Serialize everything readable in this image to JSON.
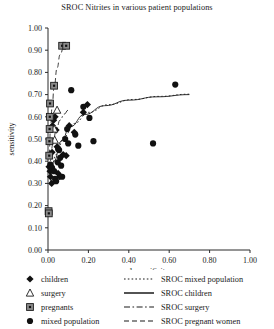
{
  "chart_data": {
    "type": "scatter",
    "title": "SROC Nitrites in various patient populations",
    "xlabel": "1-specificity",
    "ylabel": "sensitivity",
    "xlim": [
      0.0,
      1.0
    ],
    "ylim": [
      0.0,
      1.0
    ],
    "xticks": [
      "0.00",
      "0.20",
      "0.40",
      "0.60",
      "0.80",
      "1.00"
    ],
    "xtick_values": [
      0.0,
      0.2,
      0.4,
      0.6,
      0.8,
      1.0
    ],
    "yticks": [
      "0.00",
      "0.10",
      "0.20",
      "0.30",
      "0.40",
      "0.50",
      "0.60",
      "0.70",
      "0.80",
      "0.90",
      "1.00"
    ],
    "ytick_values": [
      0.0,
      0.1,
      0.2,
      0.3,
      0.4,
      0.5,
      0.6,
      0.7,
      0.8,
      0.9,
      1.0
    ],
    "grid": false,
    "legend_position": "below-plot",
    "series": [
      {
        "name": "children",
        "marker": "filled-diamond",
        "color": "#111111",
        "points": [
          [
            0.005,
            0.375
          ],
          [
            0.01,
            0.355
          ],
          [
            0.012,
            0.33
          ],
          [
            0.018,
            0.3
          ],
          [
            0.02,
            0.44
          ],
          [
            0.022,
            0.56
          ],
          [
            0.028,
            0.585
          ],
          [
            0.035,
            0.6
          ],
          [
            0.04,
            0.54
          ],
          [
            0.045,
            0.465
          ],
          [
            0.05,
            0.345
          ],
          [
            0.058,
            0.33
          ],
          [
            0.075,
            0.43
          ],
          [
            0.09,
            0.425
          ],
          [
            0.105,
            0.56
          ],
          [
            0.13,
            0.53
          ],
          [
            0.175,
            0.62
          ],
          [
            0.195,
            0.655
          ]
        ]
      },
      {
        "name": "surgery",
        "marker": "open-triangle",
        "color": "#111111",
        "points": [
          [
            0.03,
            0.545
          ],
          [
            0.045,
            0.63
          ],
          [
            0.033,
            0.495
          ]
        ]
      },
      {
        "name": "pregnants",
        "marker": "square-dot",
        "color": "#333333",
        "points": [
          [
            0.003,
            0.175
          ],
          [
            0.004,
            0.165
          ],
          [
            0.006,
            0.425
          ],
          [
            0.007,
            0.49
          ],
          [
            0.008,
            0.545
          ],
          [
            0.009,
            0.6
          ],
          [
            0.01,
            0.66
          ],
          [
            0.03,
            0.74
          ],
          [
            0.07,
            0.92
          ],
          [
            0.09,
            0.92
          ]
        ]
      },
      {
        "name": "mixed population",
        "marker": "filled-circle",
        "color": "#111111",
        "points": [
          [
            0.012,
            0.385
          ],
          [
            0.02,
            0.37
          ],
          [
            0.03,
            0.355
          ],
          [
            0.035,
            0.32
          ],
          [
            0.04,
            0.31
          ],
          [
            0.048,
            0.395
          ],
          [
            0.05,
            0.455
          ],
          [
            0.055,
            0.45
          ],
          [
            0.06,
            0.415
          ],
          [
            0.065,
            0.38
          ],
          [
            0.07,
            0.33
          ],
          [
            0.085,
            0.5
          ],
          [
            0.095,
            0.545
          ],
          [
            0.1,
            0.48
          ],
          [
            0.115,
            0.72
          ],
          [
            0.135,
            0.52
          ],
          [
            0.15,
            0.47
          ],
          [
            0.175,
            0.645
          ],
          [
            0.205,
            0.595
          ],
          [
            0.225,
            0.49
          ],
          [
            0.52,
            0.48
          ],
          [
            0.63,
            0.745
          ]
        ]
      }
    ],
    "curves": [
      {
        "name": "SROC mixed population",
        "style": "dotted",
        "path": [
          [
            0.01,
            0.33
          ],
          [
            0.04,
            0.43
          ],
          [
            0.08,
            0.51
          ],
          [
            0.13,
            0.57
          ],
          [
            0.2,
            0.62
          ],
          [
            0.3,
            0.655
          ],
          [
            0.42,
            0.678
          ],
          [
            0.55,
            0.692
          ],
          [
            0.7,
            0.702
          ]
        ]
      },
      {
        "name": "SROC children",
        "style": "solid",
        "path": [
          [
            0.008,
            0.3
          ],
          [
            0.03,
            0.4
          ],
          [
            0.065,
            0.49
          ],
          [
            0.11,
            0.555
          ],
          [
            0.18,
            0.61
          ],
          [
            0.28,
            0.65
          ],
          [
            0.4,
            0.675
          ],
          [
            0.54,
            0.69
          ],
          [
            0.7,
            0.7
          ]
        ]
      },
      {
        "name": "SROC surgery",
        "style": "dash-dot",
        "path": [
          [
            0.01,
            0.4
          ],
          [
            0.025,
            0.48
          ],
          [
            0.04,
            0.54
          ],
          [
            0.06,
            0.585
          ],
          [
            0.08,
            0.612
          ],
          [
            0.1,
            0.63
          ]
        ]
      },
      {
        "name": "SROC pregnant women",
        "style": "dashed",
        "path": [
          [
            0.006,
            0.43
          ],
          [
            0.012,
            0.54
          ],
          [
            0.02,
            0.64
          ],
          [
            0.03,
            0.73
          ],
          [
            0.045,
            0.82
          ],
          [
            0.06,
            0.88
          ],
          [
            0.078,
            0.915
          ],
          [
            0.1,
            0.928
          ]
        ]
      }
    ]
  },
  "legend": {
    "markers": [
      {
        "label": "children",
        "symbol": "filled-diamond"
      },
      {
        "label": "surgery",
        "symbol": "open-triangle"
      },
      {
        "label": "pregnants",
        "symbol": "square-dot"
      },
      {
        "label": "mixed population",
        "symbol": "filled-circle"
      }
    ],
    "lines": [
      {
        "label": "SROC mixed population",
        "style": "dotted"
      },
      {
        "label": "SROC children",
        "style": "solid"
      },
      {
        "label": "SROC surgery",
        "style": "dash-dot"
      },
      {
        "label": "SROC pregnant women",
        "style": "dashed"
      }
    ]
  }
}
